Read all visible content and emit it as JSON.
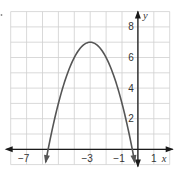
{
  "chart_data": {
    "type": "line",
    "title": "",
    "xlabel": "x",
    "ylabel": "y",
    "xlim": [
      -8,
      2
    ],
    "ylim": [
      -1,
      9
    ],
    "grid": true,
    "grid_step": {
      "x": 1,
      "y": 1
    },
    "x_tick_labels": [
      {
        "value": -7,
        "label": "−7"
      },
      {
        "value": -3,
        "label": "−3"
      },
      {
        "value": -1,
        "label": "−1"
      },
      {
        "value": 1,
        "label": "1"
      }
    ],
    "y_tick_labels": [
      {
        "value": 2,
        "label": "2"
      },
      {
        "value": 4,
        "label": "4"
      },
      {
        "value": 6,
        "label": "6"
      },
      {
        "value": 8,
        "label": "8"
      }
    ],
    "series": [
      {
        "name": "parabola",
        "equation": "y = -(x + 3)^2 + 7",
        "vertex": [
          -3,
          7
        ],
        "x_intercepts": [
          -5.65,
          -0.35
        ],
        "domain_shown": [
          -5.8,
          -0.2
        ],
        "arrows_both_ends": true,
        "color": "#555555",
        "x": [
          -5.8,
          -5.5,
          -5,
          -4.5,
          -4,
          -3.5,
          -3,
          -2.5,
          -2,
          -1.5,
          -1,
          -0.5,
          -0.2
        ],
        "values": [
          -0.84,
          0.75,
          3,
          4.75,
          6,
          6.75,
          7,
          6.75,
          6,
          4.75,
          3,
          0.75,
          -0.84
        ]
      }
    ]
  },
  "labels": {
    "x_axis": "x",
    "y_axis": "y"
  }
}
